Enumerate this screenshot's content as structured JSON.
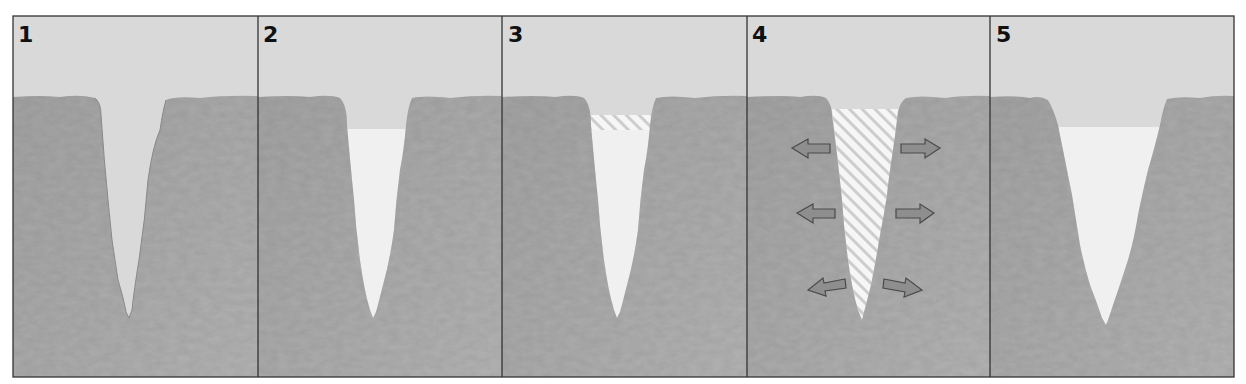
{
  "diagram": {
    "type": "frost-wedging-sequence",
    "panel_count": 5,
    "colors": {
      "sky": "#d9d9d9",
      "rock": "#a9a9a9",
      "rock_dark": "#9a9a9a",
      "rock_edge": "#8a8a8a",
      "crack_air": "#d6d6d6",
      "water": "#efefef",
      "ice_bg": "#f4f4f4",
      "ice_hatch": "#c9c9c9",
      "arrow_fill": "#8e8e8e",
      "arrow_stroke": "#4a4a4a",
      "frame": "#333333"
    },
    "panels": [
      {
        "label": "1",
        "state": "empty crack"
      },
      {
        "label": "2",
        "state": "crack filled with water"
      },
      {
        "label": "3",
        "state": "water begins to freeze at top (ice band)"
      },
      {
        "label": "4",
        "state": "ice fills crack and expands, pushing rock outward",
        "arrows": [
          "left",
          "right",
          "left",
          "right",
          "left",
          "right"
        ]
      },
      {
        "label": "5",
        "state": "widened crack refills with water"
      }
    ]
  }
}
